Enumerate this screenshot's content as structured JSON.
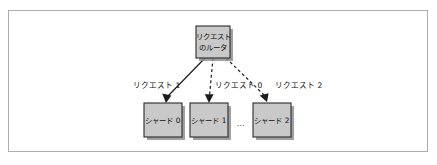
{
  "figure": {
    "frame": {
      "border_color": "#aeaeae",
      "background_color": "#ffffff"
    },
    "node_fill_color": "#c9c9c9",
    "node_border_color": "#2b2b2b",
    "line_color": "#1c1c1c",
    "text_color": "#101010"
  },
  "diagram": {
    "type": "flow-diagram",
    "router": {
      "line1": "リクエスト",
      "line2": "のルータ"
    },
    "shards": [
      {
        "label": "シャード 0"
      },
      {
        "label": "シャード 1"
      },
      {
        "label": "シャード 2"
      }
    ],
    "ellipsis": "…",
    "edges": [
      {
        "label": "リクエスト 1",
        "style": "solid",
        "from": "router",
        "to": "シャード 0"
      },
      {
        "label": "リクエスト 0",
        "style": "dashed",
        "from": "router",
        "to": "シャード 1"
      },
      {
        "label": "リクエスト 2",
        "style": "dashed",
        "from": "router",
        "to": "シャード 2"
      }
    ]
  }
}
